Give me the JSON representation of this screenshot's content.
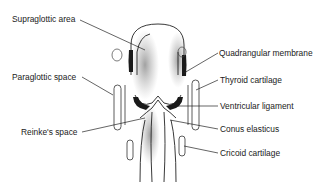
{
  "diagram": {
    "labels_left": [
      {
        "id": "supraglottic-area",
        "text": "Supraglottic area",
        "x": 12,
        "y": 14
      },
      {
        "id": "paraglottic-space",
        "text": "Paraglottic space",
        "x": 12,
        "y": 72
      },
      {
        "id": "reinkes-space",
        "text": "Reinke's space",
        "x": 21,
        "y": 127
      }
    ],
    "labels_right": [
      {
        "id": "quadrangular-membrane",
        "text": "Quadrangular membrane",
        "x": 219,
        "y": 48
      },
      {
        "id": "thyroid-cartilage",
        "text": "Thyroid cartilage",
        "x": 220,
        "y": 75
      },
      {
        "id": "ventricular-ligament",
        "text": "Ventricular ligament",
        "x": 220,
        "y": 101
      },
      {
        "id": "conus-elasticus",
        "text": "Conus elasticus",
        "x": 220,
        "y": 124
      },
      {
        "id": "cricoid-cartilage",
        "text": "Cricoid cartilage",
        "x": 220,
        "y": 148
      }
    ]
  }
}
